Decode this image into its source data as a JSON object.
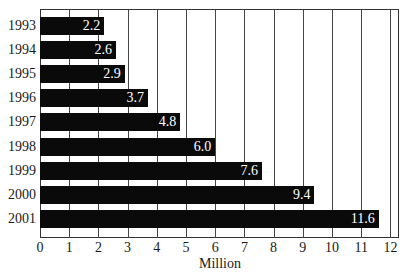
{
  "chart_data": {
    "type": "bar",
    "orientation": "horizontal",
    "title": "",
    "xlabel": "Million",
    "ylabel": "",
    "categories": [
      "1993",
      "1994",
      "1995",
      "1996",
      "1997",
      "1998",
      "1999",
      "2000",
      "2001"
    ],
    "values": [
      2.2,
      2.6,
      2.9,
      3.7,
      4.8,
      6.0,
      7.6,
      9.4,
      11.6
    ],
    "value_labels": [
      "2.2",
      "2.6",
      "2.9",
      "3.7",
      "4.8",
      "6.0",
      "7.6",
      "9.4",
      "11.6"
    ],
    "xlim": [
      0,
      12.3
    ],
    "xticks": [
      "0",
      "1",
      "2",
      "3",
      "4",
      "5",
      "6",
      "7",
      "8",
      "9",
      "10",
      "11",
      "12"
    ],
    "grid": "vertical",
    "legend": "none",
    "bar_color": "#0a0a0a",
    "label_color": "#ffffff"
  }
}
